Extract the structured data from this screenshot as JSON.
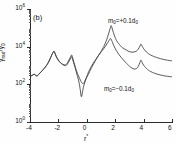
{
  "figure": {
    "panel_tag": "(b)",
    "xlabel_base": "r",
    "xlabel_sup": "*",
    "ylabel_text": "γ",
    "ylabel_sub1": "rad",
    "ylabel_mid": "/γ",
    "ylabel_sub2": "0"
  },
  "annotations": [
    {
      "id": "curve-plus-label",
      "text": "m",
      "sub": "0",
      "rest": "=+0.1d",
      "sub2": "0",
      "x": 108,
      "y": 18
    },
    {
      "id": "curve-minus-label",
      "text": "m",
      "sub": "0",
      "rest": "=−0.1d",
      "sub2": "0",
      "x": 104,
      "y": 86
    }
  ],
  "axes": {
    "ytick_labels": [
      "10",
      "10",
      "10",
      "10"
    ],
    "ytick_exponents": [
      "6",
      "4",
      "2",
      "0"
    ],
    "ytick_values": [
      1000000,
      10000,
      100,
      1
    ],
    "xtick_labels": [
      "-4",
      "-2",
      "0",
      "2",
      "4",
      "6"
    ],
    "xtick_values": [
      -4,
      -2,
      0,
      2,
      4,
      6
    ]
  },
  "chart_data": {
    "type": "line",
    "title": "",
    "panel": "(b)",
    "xlabel": "r*",
    "ylabel": "γrad/γ0",
    "xscale": "linear",
    "yscale": "log",
    "xlim": [
      -4,
      6
    ],
    "ylim": [
      1,
      1000000
    ],
    "grid": false,
    "legend_position": "inline-annotation",
    "series": [
      {
        "name": "m0=+0.1d0",
        "color": "#3a3a3a",
        "points": [
          [
            -4.0,
            260
          ],
          [
            -3.85,
            300
          ],
          [
            -3.7,
            340
          ],
          [
            -3.6,
            300
          ],
          [
            -3.5,
            280
          ],
          [
            -3.4,
            330
          ],
          [
            -3.3,
            400
          ],
          [
            -3.15,
            520
          ],
          [
            -3.0,
            700
          ],
          [
            -2.85,
            980
          ],
          [
            -2.7,
            1500
          ],
          [
            -2.55,
            2600
          ],
          [
            -2.42,
            4300
          ],
          [
            -2.32,
            5600
          ],
          [
            -2.25,
            4600
          ],
          [
            -2.15,
            3000
          ],
          [
            -2.0,
            1900
          ],
          [
            -1.85,
            1400
          ],
          [
            -1.7,
            1150
          ],
          [
            -1.55,
            1080
          ],
          [
            -1.42,
            1200
          ],
          [
            -1.3,
            1700
          ],
          [
            -1.15,
            2800
          ],
          [
            -1.06,
            3600
          ],
          [
            -1.0,
            2600
          ],
          [
            -0.9,
            1400
          ],
          [
            -0.8,
            800
          ],
          [
            -0.7,
            470
          ],
          [
            -0.6,
            300
          ],
          [
            -0.5,
            200
          ],
          [
            -0.4,
            140
          ],
          [
            -0.3,
            110
          ],
          [
            -0.2,
            120
          ],
          [
            -0.1,
            170
          ],
          [
            0.1,
            330
          ],
          [
            0.3,
            680
          ],
          [
            0.5,
            1300
          ],
          [
            0.7,
            2400
          ],
          [
            0.9,
            4200
          ],
          [
            1.1,
            7500
          ],
          [
            1.3,
            15000
          ],
          [
            1.5,
            40000
          ],
          [
            1.65,
            95000
          ],
          [
            1.72,
            130000
          ],
          [
            1.8,
            85000
          ],
          [
            1.95,
            38000
          ],
          [
            2.1,
            21000
          ],
          [
            2.3,
            13000
          ],
          [
            2.5,
            9000
          ],
          [
            2.8,
            6500
          ],
          [
            3.1,
            5200
          ],
          [
            3.4,
            5400
          ],
          [
            3.6,
            7000
          ],
          [
            3.75,
            11000
          ],
          [
            3.82,
            13500
          ],
          [
            3.95,
            9000
          ],
          [
            4.2,
            5200
          ],
          [
            4.5,
            3600
          ],
          [
            4.9,
            2700
          ],
          [
            5.3,
            2200
          ],
          [
            5.7,
            1900
          ],
          [
            6.0,
            1750
          ]
        ]
      },
      {
        "name": "m0=-0.1d0",
        "color": "#3a3a3a",
        "points": [
          [
            -4.0,
            260
          ],
          [
            -3.85,
            300
          ],
          [
            -3.7,
            340
          ],
          [
            -3.6,
            300
          ],
          [
            -3.5,
            280
          ],
          [
            -3.4,
            330
          ],
          [
            -3.3,
            400
          ],
          [
            -3.15,
            520
          ],
          [
            -3.0,
            700
          ],
          [
            -2.85,
            980
          ],
          [
            -2.7,
            1500
          ],
          [
            -2.55,
            2600
          ],
          [
            -2.42,
            4300
          ],
          [
            -2.32,
            5600
          ],
          [
            -2.25,
            4600
          ],
          [
            -2.15,
            3000
          ],
          [
            -2.0,
            1900
          ],
          [
            -1.85,
            1400
          ],
          [
            -1.7,
            1150
          ],
          [
            -1.55,
            1000
          ],
          [
            -1.42,
            1050
          ],
          [
            -1.3,
            1450
          ],
          [
            -1.15,
            2300
          ],
          [
            -1.06,
            2900
          ],
          [
            -1.0,
            2100
          ],
          [
            -0.85,
            900
          ],
          [
            -0.7,
            350
          ],
          [
            -0.55,
            130
          ],
          [
            -0.45,
            45
          ],
          [
            -0.38,
            22
          ],
          [
            -0.3,
            40
          ],
          [
            -0.2,
            90
          ],
          [
            0.0,
            260
          ],
          [
            0.2,
            600
          ],
          [
            0.45,
            1300
          ],
          [
            0.7,
            2500
          ],
          [
            0.95,
            4600
          ],
          [
            1.2,
            8000
          ],
          [
            1.42,
            14000
          ],
          [
            1.58,
            22000
          ],
          [
            1.68,
            27000
          ],
          [
            1.78,
            19000
          ],
          [
            1.95,
            9500
          ],
          [
            2.2,
            4500
          ],
          [
            2.5,
            2300
          ],
          [
            2.8,
            1300
          ],
          [
            3.1,
            800
          ],
          [
            3.4,
            650
          ],
          [
            3.6,
            850
          ],
          [
            3.75,
            1500
          ],
          [
            3.82,
            1900
          ],
          [
            3.95,
            1200
          ],
          [
            4.2,
            700
          ],
          [
            4.5,
            480
          ],
          [
            4.9,
            360
          ],
          [
            5.3,
            300
          ],
          [
            5.7,
            265
          ],
          [
            6.0,
            250
          ]
        ]
      }
    ]
  }
}
